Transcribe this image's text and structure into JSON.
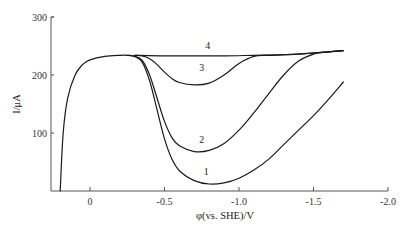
{
  "chart_data": {
    "type": "line",
    "title": "",
    "xlabel": "φ(vs. SHE)/V",
    "ylabel": "I/μA",
    "xlim": [
      0.22,
      -2.0
    ],
    "ylim": [
      0,
      300
    ],
    "x_ticks": [
      0,
      -0.5,
      -1.0,
      -1.5,
      -2.0
    ],
    "x_tick_labels": [
      "0",
      "-0.5",
      "-1.0",
      "-1.5",
      "-2.0"
    ],
    "y_ticks": [
      100,
      200,
      300
    ],
    "y_tick_labels": [
      "100",
      "200",
      "300"
    ],
    "grid": false,
    "legend": "inline curve labels",
    "series": [
      {
        "name": "1",
        "x": [
          0.2,
          0.18,
          0.15,
          0.1,
          0.05,
          0,
          -0.1,
          -0.2,
          -0.25,
          -0.3,
          -0.35,
          -0.4,
          -0.45,
          -0.5,
          -0.55,
          -0.6,
          -0.7,
          -0.8,
          -0.9,
          -1.0,
          -1.1,
          -1.2,
          -1.3,
          -1.4,
          -1.5,
          -1.6,
          -1.7
        ],
        "y": [
          0,
          100,
          160,
          200,
          218,
          226,
          232,
          234,
          234,
          232,
          222,
          190,
          140,
          90,
          55,
          35,
          18,
          12,
          14,
          22,
          36,
          55,
          80,
          105,
          130,
          158,
          188
        ]
      },
      {
        "name": "2",
        "x": [
          -0.25,
          -0.3,
          -0.35,
          -0.4,
          -0.45,
          -0.5,
          -0.55,
          -0.6,
          -0.7,
          -0.8,
          -0.9,
          -1.0,
          -1.1,
          -1.2,
          -1.3,
          -1.4,
          -1.5,
          -1.6,
          -1.7
        ],
        "y": [
          234,
          232,
          225,
          200,
          160,
          120,
          92,
          78,
          68,
          70,
          82,
          105,
          135,
          168,
          200,
          224,
          236,
          240,
          242
        ]
      },
      {
        "name": "3",
        "x": [
          -0.3,
          -0.35,
          -0.4,
          -0.45,
          -0.5,
          -0.55,
          -0.6,
          -0.7,
          -0.8,
          -0.9,
          -1.0,
          -1.1,
          -1.2,
          -1.4,
          -1.6,
          -1.7
        ],
        "y": [
          234,
          233,
          228,
          218,
          205,
          194,
          187,
          183,
          186,
          200,
          220,
          232,
          234,
          236,
          240,
          242
        ]
      },
      {
        "name": "4",
        "x": [
          -0.3,
          -0.5,
          -0.7,
          -0.9,
          -1.1,
          -1.3,
          -1.5,
          -1.6,
          -1.7
        ],
        "y": [
          234,
          233,
          233,
          233,
          234,
          235,
          238,
          240,
          242
        ]
      }
    ],
    "annotations": [
      {
        "text": "4",
        "x": -0.79,
        "y": 244
      },
      {
        "text": "3",
        "x": -0.75,
        "y": 207
      },
      {
        "text": "2",
        "x": -0.75,
        "y": 82
      },
      {
        "text": "1",
        "x": -0.78,
        "y": 28
      }
    ]
  },
  "colors": {
    "axis": "#555555",
    "curve": "#1a1a1a",
    "background": "#ffffff"
  }
}
